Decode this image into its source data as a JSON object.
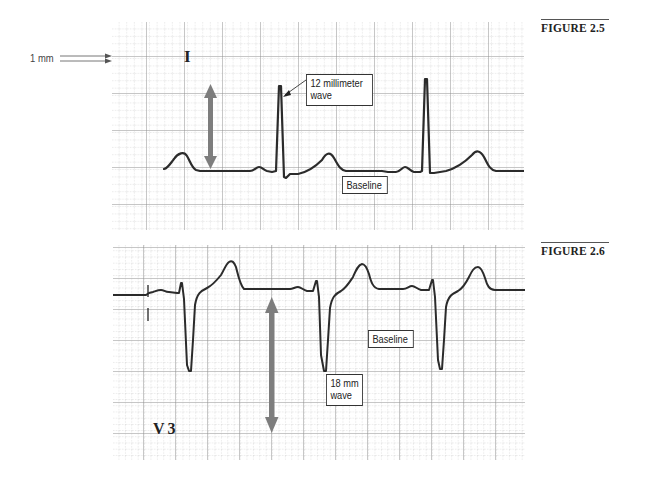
{
  "figures": [
    {
      "id": "fig-2-5",
      "label": "FIGURE 2.5",
      "lead": "I",
      "scale_label": "1 mm",
      "callouts": {
        "wave": "12 millimeter\nwave",
        "baseline": "Baseline"
      },
      "measurement_mm": 12
    },
    {
      "id": "fig-2-6",
      "label": "FIGURE 2.6",
      "lead": "V3",
      "callouts": {
        "wave": "18 mm\nwave",
        "baseline": "Baseline"
      },
      "measurement_mm": 18
    }
  ],
  "colors": {
    "grid_major": "#8a8a8a",
    "grid_minor": "#c8c8c8",
    "trace": "#2a2a2a",
    "arrow": "#7a7a7a"
  }
}
